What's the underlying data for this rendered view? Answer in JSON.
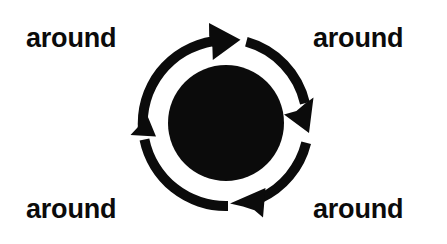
{
  "canvas": {
    "width": 447,
    "height": 244,
    "background_color": "#ffffff",
    "ink_color": "#0b0b0b"
  },
  "diagram": {
    "kind": "circular-cycle-arrows",
    "title_text": "around",
    "center_node": {
      "shape": "filled-circle",
      "color": "#0b0b0b",
      "center_x": 226,
      "center_y": 123,
      "radius": 58
    },
    "ring": {
      "outer_radius": 88,
      "stroke_width": 10,
      "direction": "clockwise",
      "segment_count": 4,
      "arrowhead_count": 4
    },
    "segments": [
      {
        "name": "top-arc",
        "from_clock": "9",
        "to_clock": "1",
        "arrowhead": "right"
      },
      {
        "name": "right-arc",
        "from_clock": "1",
        "to_clock": "4",
        "arrowhead": "down"
      },
      {
        "name": "bottom-arc",
        "from_clock": "4",
        "to_clock": "6",
        "arrowhead": "left"
      },
      {
        "name": "left-arc",
        "from_clock": "6",
        "to_clock": "9",
        "arrowhead": "up"
      }
    ]
  },
  "labels": {
    "top_left": "around",
    "top_right": "around",
    "bottom_left": "around",
    "bottom_right": "around"
  }
}
